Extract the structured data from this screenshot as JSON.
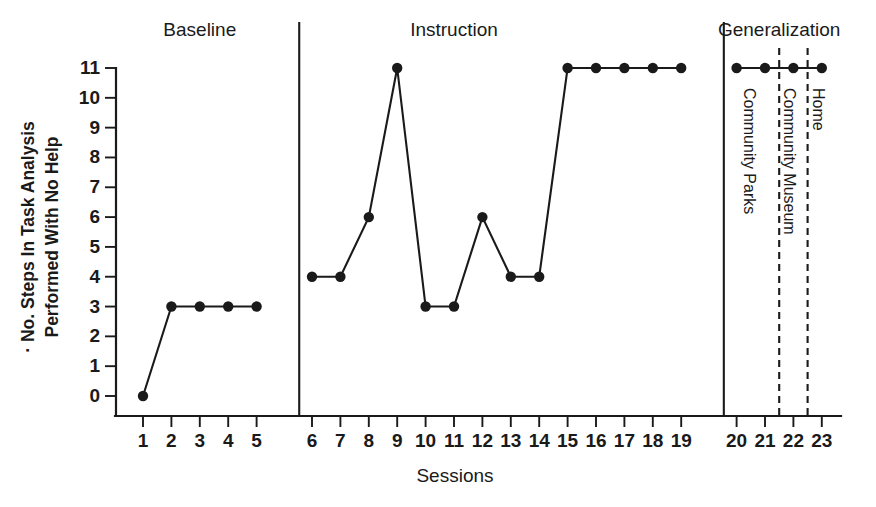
{
  "chart_data": {
    "type": "line",
    "title": "",
    "xlabel": "Sessions",
    "ylabel_line1": "· No. Steps In Task Analysis",
    "ylabel_line2": "Performed With No Help",
    "xlim": [
      0.4,
      23.6
    ],
    "ylim": [
      0,
      11
    ],
    "grid": false,
    "legend": "none",
    "yticks": [
      "0",
      "1",
      "2",
      "3",
      "4",
      "5",
      "6",
      "7",
      "8",
      "9",
      "10",
      "11"
    ],
    "ytick_values": [
      0,
      1,
      2,
      3,
      4,
      5,
      6,
      7,
      8,
      9,
      10,
      11
    ],
    "xticks": [
      "1",
      "2",
      "3",
      "4",
      "5",
      "6",
      "7",
      "8",
      "9",
      "10",
      "11",
      "12",
      "13",
      "14",
      "15",
      "16",
      "17",
      "18",
      "19",
      "20",
      "21",
      "22",
      "23"
    ],
    "xtick_values": [
      1,
      2,
      3,
      4,
      5,
      6,
      7,
      8,
      9,
      10,
      11,
      12,
      13,
      14,
      15,
      16,
      17,
      18,
      19,
      20,
      21,
      22,
      23
    ],
    "x": [
      1,
      2,
      3,
      4,
      5,
      6,
      7,
      8,
      9,
      10,
      11,
      12,
      13,
      14,
      15,
      16,
      17,
      18,
      19,
      20,
      21,
      22,
      23
    ],
    "values": [
      0,
      3,
      3,
      3,
      3,
      4,
      4,
      6,
      11,
      3,
      3,
      6,
      4,
      4,
      11,
      11,
      11,
      11,
      11,
      11,
      11,
      11,
      11
    ],
    "series": [
      {
        "name": "Baseline",
        "x": [
          1,
          2,
          3,
          4,
          5
        ],
        "values": [
          0,
          3,
          3,
          3,
          3
        ]
      },
      {
        "name": "Instruction",
        "x": [
          6,
          7,
          8,
          9,
          10,
          11,
          12,
          13,
          14,
          15,
          16,
          17,
          18,
          19
        ],
        "values": [
          4,
          4,
          6,
          11,
          3,
          3,
          6,
          4,
          4,
          11,
          11,
          11,
          11,
          11
        ]
      },
      {
        "name": "Generalization",
        "x": [
          20,
          21,
          22,
          23
        ],
        "values": [
          11,
          11,
          11,
          11
        ]
      }
    ],
    "phases": [
      {
        "label": "Baseline",
        "x_start": 1,
        "x_end": 5,
        "title_x": 3.0
      },
      {
        "label": "Instruction",
        "x_start": 6,
        "x_end": 19,
        "title_x": 11.0
      },
      {
        "label": "Generalization",
        "x_start": 20,
        "x_end": 23,
        "title_x": 21.5
      }
    ],
    "phase_dividers": [
      5.55,
      19.55
    ],
    "conditions": [
      {
        "label": "Community Parks",
        "x_start": 20,
        "x_end": 21.5,
        "label_x": 20.4
      },
      {
        "label": "Community Museum",
        "x_start": 21.5,
        "x_end": 22.5,
        "label_x": 21.8
      },
      {
        "label": "Home",
        "x_start": 22.5,
        "x_end": 23,
        "label_x": 22.85
      }
    ],
    "condition_dividers": [
      21.5,
      22.5
    ],
    "colors": {
      "line": "#1a1a1a",
      "marker": "#1a1a1a",
      "axis": "#1a1a1a",
      "background": "#ffffff"
    }
  }
}
